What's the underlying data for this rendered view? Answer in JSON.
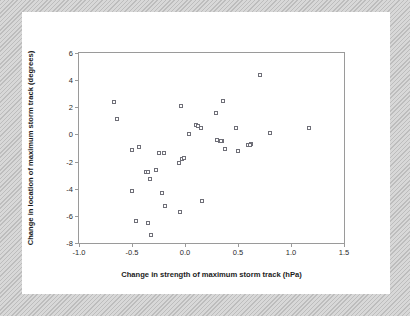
{
  "figure": {
    "background_color": "#ffffff",
    "page_border_color": "#c8c8c8",
    "marker_edge_color": "#6f6f78",
    "marker_face_color": "#ffffff"
  },
  "chart_data": {
    "type": "scatter",
    "title": "",
    "xlabel": "Change in strength of maximum storm track (hPa)",
    "ylabel": "Change in location of maximum storm track (degrees)",
    "xlim": [
      -1.0,
      1.5
    ],
    "ylim": [
      -8,
      6
    ],
    "xticks": [
      -1.0,
      -0.5,
      0.0,
      0.5,
      1.0,
      1.5
    ],
    "xticklabels": [
      "-1.0",
      "-0.5",
      "0.0",
      "0.5",
      "1.0",
      "1.5"
    ],
    "yticks": [
      6,
      4,
      2,
      0,
      -2,
      -4,
      -6,
      -8
    ],
    "yticklabels": [
      "6",
      "4",
      "2",
      "0",
      "-2",
      "-4",
      "-6",
      "-8"
    ],
    "grid": false,
    "legend": null,
    "marker": "open-square",
    "n_points": 41,
    "points": [
      {
        "x": -0.67,
        "y": 2.4
      },
      {
        "x": -0.64,
        "y": 1.15
      },
      {
        "x": -0.5,
        "y": -1.15
      },
      {
        "x": -0.43,
        "y": -0.9
      },
      {
        "x": -0.5,
        "y": -4.15
      },
      {
        "x": -0.46,
        "y": -6.35
      },
      {
        "x": -0.37,
        "y": -2.75
      },
      {
        "x": -0.35,
        "y": -6.5
      },
      {
        "x": -0.33,
        "y": -3.3
      },
      {
        "x": -0.32,
        "y": -7.4
      },
      {
        "x": -0.27,
        "y": -2.65
      },
      {
        "x": -0.25,
        "y": -1.4
      },
      {
        "x": -0.22,
        "y": -4.35
      },
      {
        "x": -0.2,
        "y": -1.35
      },
      {
        "x": -0.19,
        "y": -5.3
      },
      {
        "x": -0.06,
        "y": -2.1
      },
      {
        "x": -0.05,
        "y": -5.7
      },
      {
        "x": -0.03,
        "y": -1.8
      },
      {
        "x": -0.01,
        "y": -1.75
      },
      {
        "x": -0.04,
        "y": 2.1
      },
      {
        "x": 0.04,
        "y": 0.0
      },
      {
        "x": 0.1,
        "y": 0.7
      },
      {
        "x": 0.15,
        "y": 0.45
      },
      {
        "x": 0.16,
        "y": -4.9
      },
      {
        "x": 0.29,
        "y": 1.55
      },
      {
        "x": 0.3,
        "y": -0.4
      },
      {
        "x": 0.33,
        "y": -0.5
      },
      {
        "x": 0.35,
        "y": -0.5
      },
      {
        "x": 0.36,
        "y": 2.5
      },
      {
        "x": 0.38,
        "y": -1.05
      },
      {
        "x": 0.48,
        "y": 0.45
      },
      {
        "x": 0.5,
        "y": -1.2
      },
      {
        "x": 0.59,
        "y": -0.8
      },
      {
        "x": 0.62,
        "y": -0.7
      },
      {
        "x": 0.71,
        "y": 4.4
      },
      {
        "x": 0.8,
        "y": 0.1
      },
      {
        "x": 1.17,
        "y": 0.45
      },
      {
        "x": -0.35,
        "y": -2.8
      },
      {
        "x": 0.12,
        "y": 0.6
      },
      {
        "x": 0.34,
        "y": -0.45
      },
      {
        "x": 0.61,
        "y": -0.75
      }
    ]
  }
}
